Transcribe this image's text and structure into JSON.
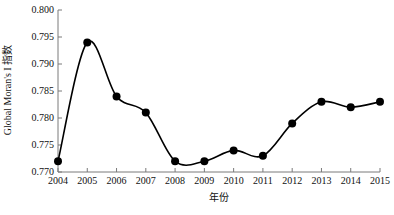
{
  "chart_data": {
    "type": "line",
    "title": "",
    "xlabel": "年份",
    "ylabel": "Global Moran's I 指数",
    "categories": [
      2004,
      2005,
      2006,
      2007,
      2008,
      2009,
      2010,
      2011,
      2012,
      2013,
      2014,
      2015
    ],
    "x_tick_labels": [
      "2004",
      "2005",
      "2006",
      "2007",
      "2008",
      "2009",
      "2010",
      "2011",
      "2012",
      "2013",
      "2014",
      "2015"
    ],
    "values": [
      0.772,
      0.794,
      0.784,
      0.781,
      0.772,
      0.772,
      0.774,
      0.773,
      0.779,
      0.783,
      0.782,
      0.783
    ],
    "y_tick_values": [
      0.77,
      0.775,
      0.78,
      0.785,
      0.79,
      0.795,
      0.8
    ],
    "y_tick_labels": [
      "0.770",
      "0.775",
      "0.780",
      "0.785",
      "0.790",
      "0.795",
      "0.800"
    ],
    "ylim": [
      0.77,
      0.8
    ],
    "xlim": [
      2004,
      2015
    ],
    "grid": false,
    "legend": false,
    "series": [
      {
        "name": "Global Moran's I 指数",
        "values": [
          0.772,
          0.794,
          0.784,
          0.781,
          0.772,
          0.772,
          0.774,
          0.773,
          0.779,
          0.783,
          0.782,
          0.783
        ],
        "line_color": "#000000",
        "marker": "circle",
        "marker_color": "#000000",
        "smoothed": true
      }
    ],
    "colors": {
      "line": "#000000",
      "marker": "#000000",
      "axis": "#7a7a7a",
      "text": "#111111",
      "background": "#ffffff"
    }
  }
}
